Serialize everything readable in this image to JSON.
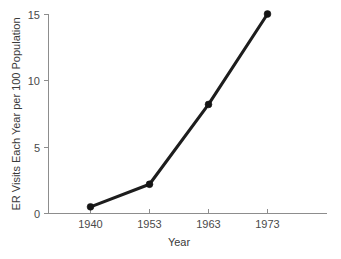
{
  "chart_data": {
    "type": "line",
    "title": "",
    "subtitle": "",
    "xlabel": "Year",
    "ylabel": "ER Visits Each Year per 100 Population",
    "categories": [
      "1940",
      "1953",
      "1963",
      "1973"
    ],
    "x": [
      1940,
      1953,
      1963,
      1973
    ],
    "values": [
      0.5,
      2.2,
      8.2,
      15.0
    ],
    "series": [
      {
        "name": "ER Visits Each Year per 100 Population",
        "values": [
          0.5,
          2.2,
          8.2,
          15.0
        ]
      }
    ],
    "xtick_labels": [
      "1940",
      "1953",
      "1963",
      "1973"
    ],
    "ytick_labels": [
      "0",
      "5",
      "10",
      "15"
    ],
    "ytick_values": [
      0,
      5,
      10,
      15
    ],
    "ylim": [
      0,
      15
    ],
    "grid": false,
    "legend": false,
    "legend_position": "none",
    "marker": "circle",
    "line_color": "#1d1d1d",
    "axis_color": "#8d8d8d",
    "background_color": "#ffffff"
  },
  "axes": {
    "x_title": "Year",
    "y_title": "ER Visits Each Year per 100 Population"
  },
  "ticks": {
    "y": [
      {
        "label": "15",
        "value": 15
      },
      {
        "label": "10",
        "value": 10
      },
      {
        "label": "5",
        "value": 5
      },
      {
        "label": "0",
        "value": 0
      }
    ],
    "x": [
      {
        "label": "1940",
        "value": 1940
      },
      {
        "label": "1953",
        "value": 1953
      },
      {
        "label": "1963",
        "value": 1963
      },
      {
        "label": "1973",
        "value": 1973
      }
    ]
  }
}
